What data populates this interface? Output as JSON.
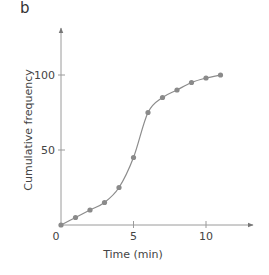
{
  "panel_label": "b",
  "chart_data": {
    "type": "line",
    "title": "",
    "xlabel": "Time (min)",
    "ylabel": "Cumulative frequency",
    "x": [
      0,
      1,
      2,
      3,
      4,
      5,
      6,
      7,
      8,
      9,
      10,
      11
    ],
    "series": [
      {
        "name": "Cumulative frequency",
        "values": [
          0,
          5,
          10,
          15,
          25,
          45,
          75,
          85,
          90,
          95,
          98,
          100
        ]
      }
    ],
    "x_ticks": [
      0,
      5,
      10
    ],
    "x_tick_labels": [
      "0",
      "5",
      "10"
    ],
    "y_ticks": [
      50,
      100
    ],
    "y_tick_labels": [
      "50",
      "100"
    ],
    "xlim": [
      0,
      13
    ],
    "ylim": [
      0,
      130
    ],
    "grid": false,
    "legend": null,
    "markers": true,
    "smooth": true,
    "colors": {
      "line": "#8c8c8c",
      "marker": "#8a8a8a",
      "axis": "#9a9a9a",
      "text": "#444444"
    }
  }
}
